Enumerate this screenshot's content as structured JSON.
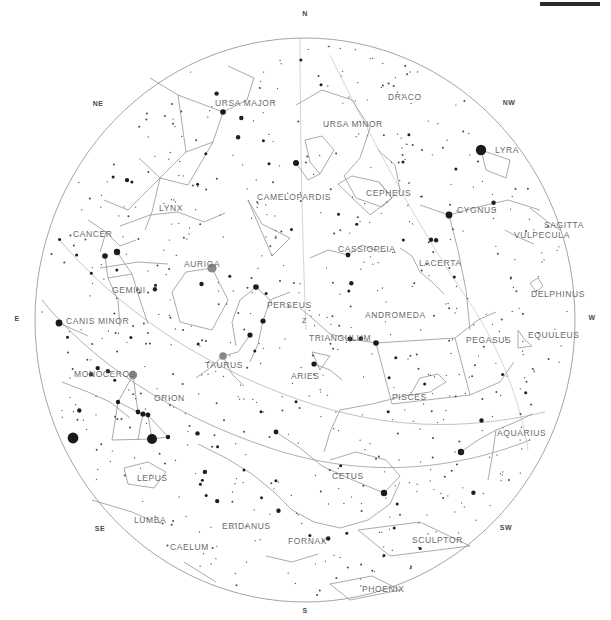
{
  "app": {
    "title": "Star Chart",
    "type": "all-sky planisphere"
  },
  "topbar": {
    "label": ""
  },
  "chart_data": {
    "type": "scatter",
    "projection": "stereographic horizon (zenith-centered)",
    "grid": false,
    "legend_position": "none",
    "center": {
      "x": 305,
      "y": 320
    },
    "radius": 270,
    "zenith_marker": "Z",
    "cardinals": [
      {
        "label": "N",
        "x": 305,
        "y": 16
      },
      {
        "label": "NE",
        "x": 98,
        "y": 106
      },
      {
        "label": "E",
        "x": 17,
        "y": 321
      },
      {
        "label": "SE",
        "x": 100,
        "y": 531
      },
      {
        "label": "S",
        "x": 305,
        "y": 613
      },
      {
        "label": "SW",
        "x": 506,
        "y": 530
      },
      {
        "label": "W",
        "x": 592,
        "y": 320
      },
      {
        "label": "NW",
        "x": 509,
        "y": 105
      }
    ],
    "constellations": [
      {
        "name": "URSA MAJOR",
        "x": 215,
        "y": 106
      },
      {
        "name": "URSA MINOR",
        "x": 323,
        "y": 127
      },
      {
        "name": "DRACO",
        "x": 388,
        "y": 100
      },
      {
        "name": "LYRA",
        "x": 495,
        "y": 153
      },
      {
        "name": "CEPHEUS",
        "x": 366,
        "y": 196
      },
      {
        "name": "CYGNUS",
        "x": 457,
        "y": 213
      },
      {
        "name": "SAGITTA",
        "x": 544,
        "y": 228
      },
      {
        "name": "VULPECULA",
        "x": 514,
        "y": 238
      },
      {
        "name": "CAMELOPARDIS",
        "x": 257,
        "y": 200
      },
      {
        "name": "LYNX",
        "x": 159,
        "y": 211
      },
      {
        "name": "CANCER",
        "x": 73,
        "y": 237
      },
      {
        "name": "CASSIOPEIA",
        "x": 338,
        "y": 252
      },
      {
        "name": "LACERTA",
        "x": 419,
        "y": 266
      },
      {
        "name": "AURIGA",
        "x": 184,
        "y": 267
      },
      {
        "name": "DELPHINUS",
        "x": 531,
        "y": 297
      },
      {
        "name": "GEMINI",
        "x": 112,
        "y": 293
      },
      {
        "name": "PERSEUS",
        "x": 267,
        "y": 308
      },
      {
        "name": "ANDROMEDA",
        "x": 365,
        "y": 318
      },
      {
        "name": "CANIS MINOR",
        "x": 66,
        "y": 324
      },
      {
        "name": "EQUULEUS",
        "x": 528,
        "y": 338
      },
      {
        "name": "TRIANGULUM",
        "x": 309,
        "y": 341
      },
      {
        "name": "PEGASUS",
        "x": 466,
        "y": 343
      },
      {
        "name": "TAURUS",
        "x": 205,
        "y": 368
      },
      {
        "name": "ARIES",
        "x": 291,
        "y": 379
      },
      {
        "name": "MONOCEROS",
        "x": 74,
        "y": 377
      },
      {
        "name": "ORION",
        "x": 154,
        "y": 401
      },
      {
        "name": "PISCES",
        "x": 392,
        "y": 400
      },
      {
        "name": "AQUARIUS",
        "x": 497,
        "y": 436
      },
      {
        "name": "LEPUS",
        "x": 137,
        "y": 481
      },
      {
        "name": "CETUS",
        "x": 332,
        "y": 479
      },
      {
        "name": "LUMBA",
        "x": 134,
        "y": 523
      },
      {
        "name": "ERIDANUS",
        "x": 222,
        "y": 529
      },
      {
        "name": "SCULPTOR",
        "x": 412,
        "y": 543
      },
      {
        "name": "FORNAX",
        "x": 288,
        "y": 544
      },
      {
        "name": "CAELUM",
        "x": 170,
        "y": 550
      },
      {
        "name": "PHOENIX",
        "x": 362,
        "y": 592
      }
    ],
    "star_magnitude_scale": {
      "brightest_radius_px": 5.5,
      "faintest_radius_px": 0.7,
      "color": "#1a1a1a",
      "note": "marker radius encodes apparent magnitude"
    },
    "bright_stars": [
      {
        "name": "Vega",
        "x": 481,
        "y": 150,
        "r": 5.2
      },
      {
        "name": "Capella",
        "x": 212,
        "y": 268,
        "r": 4.6,
        "fill": "#888"
      },
      {
        "name": "Sirius",
        "x": 73,
        "y": 438,
        "r": 5.4
      },
      {
        "name": "Procyon",
        "x": 59,
        "y": 323,
        "r": 3.4
      },
      {
        "name": "Betelgeuse",
        "x": 133,
        "y": 375,
        "r": 4.2,
        "fill": "#888"
      },
      {
        "name": "Rigel",
        "x": 152,
        "y": 439,
        "r": 5.0
      },
      {
        "name": "Aldebaran",
        "x": 223,
        "y": 356,
        "r": 3.8,
        "fill": "#888"
      },
      {
        "name": "Deneb",
        "x": 449,
        "y": 215,
        "r": 3.4
      },
      {
        "name": "Pollux",
        "x": 117,
        "y": 252,
        "r": 3.2
      },
      {
        "name": "Castor",
        "x": 105,
        "y": 256,
        "r": 2.8
      },
      {
        "name": "Polaris",
        "x": 296,
        "y": 163,
        "r": 3.0
      },
      {
        "name": "Dubhe",
        "x": 223,
        "y": 112,
        "r": 2.8
      },
      {
        "name": "Fomalhaut",
        "x": 461,
        "y": 452,
        "r": 3.2
      },
      {
        "name": "Diphda",
        "x": 384,
        "y": 493,
        "r": 3.2
      },
      {
        "name": "Hamal",
        "x": 314,
        "y": 364,
        "r": 2.6
      },
      {
        "name": "Mirfak",
        "x": 256,
        "y": 287,
        "r": 2.8
      },
      {
        "name": "Algol",
        "x": 263,
        "y": 321,
        "r": 2.6
      },
      {
        "name": "Alpheratz",
        "x": 376,
        "y": 343,
        "r": 2.8
      },
      {
        "name": "Mirach",
        "x": 350,
        "y": 339,
        "r": 2.4
      },
      {
        "name": "Menkar",
        "x": 276,
        "y": 432,
        "r": 2.4
      },
      {
        "name": "Schedar",
        "x": 348,
        "y": 255,
        "r": 2.4
      },
      {
        "name": "Elnath",
        "x": 250,
        "y": 335,
        "r": 2.6
      },
      {
        "name": "Alnilam",
        "x": 143,
        "y": 414,
        "r": 2.6
      },
      {
        "name": "Alnitak",
        "x": 148,
        "y": 415,
        "r": 2.4
      },
      {
        "name": "Mintaka",
        "x": 138,
        "y": 412,
        "r": 2.4
      },
      {
        "name": "Saiph",
        "x": 168,
        "y": 437,
        "r": 2.2
      },
      {
        "name": "Bellatrix",
        "x": 118,
        "y": 402,
        "r": 2.2
      }
    ],
    "ecliptic": {
      "label": "ecliptic",
      "style": "thin-solid-curve",
      "description": "long arc sweeping from upper-left (Cancer/Gemini) down through Taurus, Aries, Pisces to Aquarius at lower right"
    },
    "horizon_circle": {
      "label": "horizon",
      "style": "thin-solid-circle",
      "stroke": "#8a8a8a"
    }
  },
  "colors": {
    "background": "#ffffff",
    "star": "#1a1a1a",
    "star_medium": "#888888",
    "line": "#9a9a9a",
    "label": "#6a6a6a",
    "cardinal": "#4a4a4a",
    "topbar": "#2a2a2a"
  }
}
